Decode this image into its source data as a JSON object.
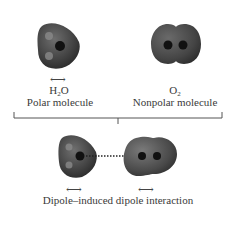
{
  "top": {
    "water": {
      "formula_main": "H",
      "formula_sub": "2",
      "formula_tail": "O",
      "description": "Polar molecule",
      "dipole_arrow": "⟷"
    },
    "oxygen": {
      "formula_main": "O",
      "formula_sub": "2",
      "description": "Nonpolar molecule"
    }
  },
  "bottom": {
    "water_dipole_arrow": "⟷",
    "oxygen_induced_arrow": "⟷",
    "caption": "Dipole–induced dipole interaction"
  },
  "colors": {
    "molecule_body": "#4a4a4a",
    "molecule_highlight": "#8a8a8a",
    "atom_core": "#111111",
    "bracket": "#555555"
  }
}
